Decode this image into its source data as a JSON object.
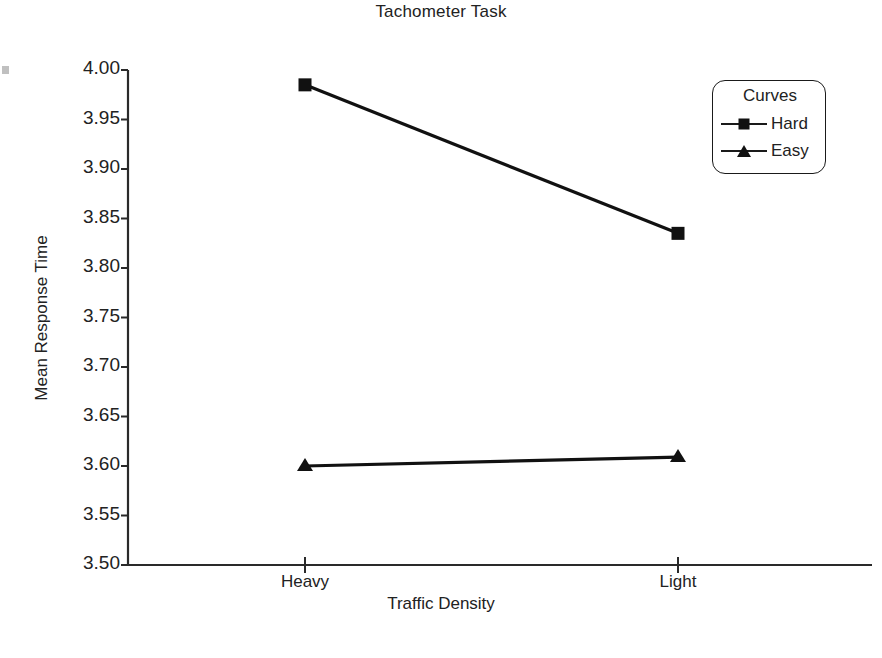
{
  "chart_data": {
    "type": "line",
    "title": "Tachometer Task",
    "xlabel": "Traffic Density",
    "ylabel": "Mean Response Time",
    "categories": [
      "Heavy",
      "Light"
    ],
    "series": [
      {
        "name": "Hard",
        "marker": "square",
        "values": [
          3.985,
          3.835
        ]
      },
      {
        "name": "Easy",
        "marker": "triangle",
        "values": [
          3.6,
          3.609
        ]
      }
    ],
    "ylim": [
      3.5,
      4.0
    ],
    "ytick_labels": [
      "4.00",
      "3.95",
      "3.90",
      "3.85",
      "3.80",
      "3.75",
      "3.70",
      "3.65",
      "3.60",
      "3.55",
      "3.50"
    ],
    "ytick_values": [
      4.0,
      3.95,
      3.9,
      3.85,
      3.8,
      3.75,
      3.7,
      3.65,
      3.6,
      3.55,
      3.5
    ],
    "grid": false,
    "legend": {
      "title": "Curves",
      "position": "top-right",
      "entries": [
        {
          "label": "Hard",
          "marker": "square"
        },
        {
          "label": "Easy",
          "marker": "triangle"
        }
      ]
    },
    "line_color": "#111111",
    "axis_color": "#2a2a2a",
    "background": "#ffffff"
  }
}
